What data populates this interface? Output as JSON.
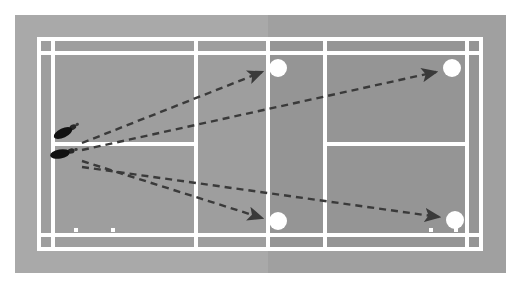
{
  "figure": {
    "caption": ""
  },
  "colors": {
    "court_near_surface": "#9e9e9e",
    "court_far_surface": "#949494",
    "court_surround": "#a8a8a8",
    "line_color": "#ffffff",
    "arrow_color": "#3a3a3a",
    "shuttle_color": "#ffffff",
    "footprint_color": "#111111",
    "page_background": "#ffffff"
  },
  "court": {
    "name": "badminton-court",
    "orientation": "horizontal",
    "net_x": 253,
    "surround_margin": 22,
    "lines": [
      {
        "name": "outer-doubles-boundary",
        "type": "rect"
      },
      {
        "name": "singles-top-sideline",
        "type": "horizontal"
      },
      {
        "name": "singles-bottom-sideline",
        "type": "horizontal"
      },
      {
        "name": "center-service-line-left",
        "type": "horizontal"
      },
      {
        "name": "center-service-line-right",
        "type": "horizontal"
      },
      {
        "name": "left-doubles-long-service-line",
        "type": "vertical"
      },
      {
        "name": "right-doubles-long-service-line",
        "type": "vertical"
      },
      {
        "name": "left-short-service-line",
        "type": "vertical"
      },
      {
        "name": "right-short-service-line",
        "type": "vertical"
      },
      {
        "name": "net-line",
        "type": "vertical"
      }
    ]
  },
  "player": {
    "name": "player-footprints",
    "label": "Player starting position",
    "footprints": [
      {
        "name": "footprint-upper",
        "x": 48,
        "y": 118,
        "rotation": -28
      },
      {
        "name": "footprint-lower",
        "x": 45,
        "y": 139,
        "rotation": -12
      }
    ]
  },
  "shuttles": [
    {
      "name": "shuttle-landing-1",
      "label": "Target 1",
      "x": 263,
      "y": 53,
      "r": 9
    },
    {
      "name": "shuttle-landing-2",
      "label": "Target 2",
      "x": 437,
      "y": 53,
      "r": 9
    },
    {
      "name": "shuttle-landing-3",
      "label": "Target 3",
      "x": 263,
      "y": 206,
      "r": 9
    },
    {
      "name": "shuttle-landing-4",
      "label": "Target 4",
      "x": 440,
      "y": 205,
      "r": 9
    }
  ],
  "trajectories": [
    {
      "name": "trajectory-to-target-1",
      "label": "Shot 1: straight cross-court lift to near left corner",
      "from": {
        "x": 67,
        "y": 128
      },
      "to": {
        "x": 250,
        "y": 57
      }
    },
    {
      "name": "trajectory-to-target-2",
      "label": "Shot 2: long cross-court clear to far left corner",
      "from": {
        "x": 67,
        "y": 135
      },
      "to": {
        "x": 424,
        "y": 57
      }
    },
    {
      "name": "trajectory-to-target-3",
      "label": "Shot 3: straight drop to near right corner",
      "from": {
        "x": 67,
        "y": 146
      },
      "to": {
        "x": 250,
        "y": 203
      }
    },
    {
      "name": "trajectory-to-target-4",
      "label": "Shot 4: long cross-court drive to far right corner",
      "from": {
        "x": 67,
        "y": 152
      },
      "to": {
        "x": 427,
        "y": 203
      }
    }
  ],
  "markers": [
    {
      "name": "court-marker-dot-left",
      "x": 75,
      "y": 222
    },
    {
      "name": "court-marker-dot-center-left",
      "x": 112,
      "y": 222
    },
    {
      "name": "court-marker-dot-right",
      "x": 430,
      "y": 222
    },
    {
      "name": "court-marker-dot-far-right",
      "x": 455,
      "y": 222
    }
  ]
}
